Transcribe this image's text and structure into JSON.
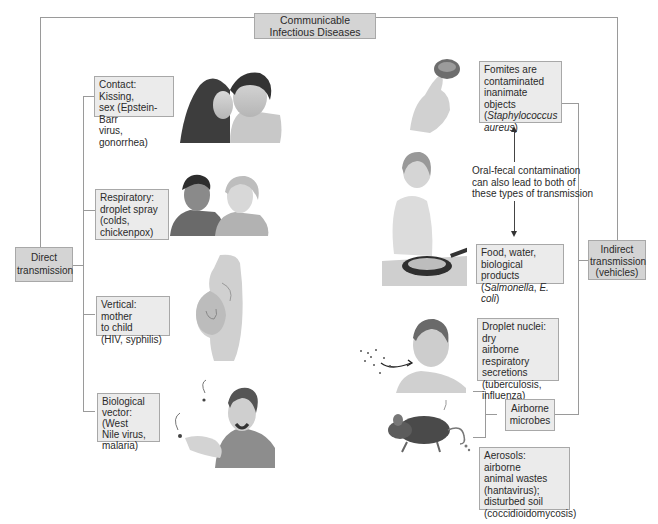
{
  "title": {
    "line1": "Communicable",
    "line2": "Infectious Diseases"
  },
  "direct": {
    "label_line1": "Direct",
    "label_line2": "transmission",
    "items": [
      {
        "lines": [
          "Contact: Kissing,",
          "sex (Epstein-Barr",
          "virus, gonorrhea)"
        ],
        "illustration": "two-people-kissing-illustration"
      },
      {
        "lines": [
          "Respiratory:",
          "droplet spray",
          "(colds,",
          "chickenpox)"
        ],
        "illustration": "two-women-talking-illustration"
      },
      {
        "lines": [
          "Vertical: mother",
          "to child",
          "(HIV, syphilis)"
        ],
        "illustration": "pregnant-woman-illustration"
      },
      {
        "lines": [
          "Biological",
          "vector: (West",
          "Nile virus,",
          "malaria)"
        ],
        "illustration": "man-swatting-mosquitoes-illustration"
      }
    ]
  },
  "indirect": {
    "label_line1": "Indirect",
    "label_line2": "transmission",
    "label_line3": "(vehicles)",
    "fomites": {
      "line1": "Fomites are",
      "line2": "contaminated",
      "line3": "inanimate objects",
      "line4_italic": "Staphylococcus",
      "line5_italic": "aureus"
    },
    "oral_fecal_note": [
      "Oral-fecal contamination",
      "can also lead to both of",
      "these types of transmission"
    ],
    "food": {
      "line1": "Food, water,",
      "line2": "biological products",
      "italic1": "Salmonella",
      "italic2": "E. coli"
    },
    "airborne_label_line1": "Airborne",
    "airborne_label_line2": "microbes",
    "droplet_nuclei": [
      "Droplet nuclei: dry",
      "airborne respiratory",
      "secretions",
      "(tuberculosis,",
      "influenza)"
    ],
    "aerosols": [
      "Aerosols: airborne",
      "animal wastes",
      "(hantavirus);",
      "disturbed soil",
      "(coccidioidomycosis)"
    ]
  },
  "colors": {
    "box_dark": "#d4d4d4",
    "box_light": "#ebebeb",
    "connector": "#9a9a9a"
  }
}
